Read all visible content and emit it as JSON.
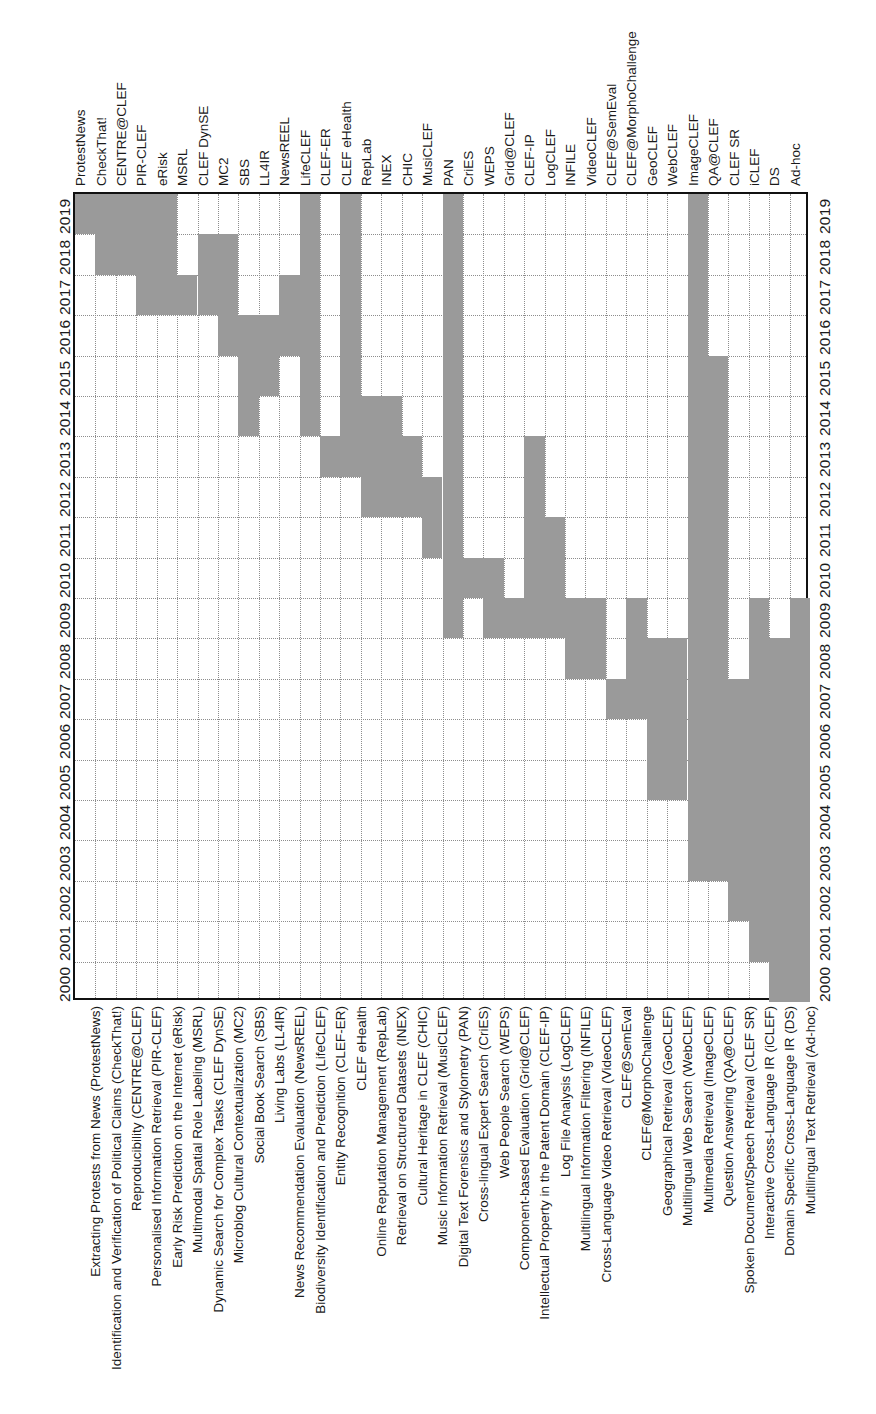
{
  "figure": {
    "kind": "timeline-matrix",
    "cell_color": "#9a9a9a",
    "grid_color": "#8d8d8d",
    "frame_color": "#111111"
  },
  "axes": {
    "year_axis_label": "",
    "lab_axis_label": "",
    "years": [
      2000,
      2001,
      2002,
      2003,
      2004,
      2005,
      2006,
      2007,
      2008,
      2009,
      2010,
      2011,
      2012,
      2013,
      2014,
      2015,
      2016,
      2017,
      2018,
      2019
    ]
  },
  "chart_data": {
    "type": "heatmap",
    "title": "",
    "subtitle": "",
    "xlabel": "",
    "ylabel": "",
    "grid": true,
    "legend": "none",
    "orientation": "labs-on-horizontal-axis, years-on-vertical-axis-ascending-upward",
    "x": [
      "ProtestNews",
      "CheckThat!",
      "CENTRE@CLEF",
      "PIR-CLEF",
      "eRisk",
      "MSRL",
      "CLEF DynSE",
      "MC2",
      "SBS",
      "LL4IR",
      "NewsREEL",
      "LifeCLEF",
      "CLEF-ER",
      "CLEF eHealth",
      "RepLab",
      "INEX",
      "CHIC",
      "MusiCLEF",
      "PAN",
      "CriES",
      "WEPS",
      "Grid@CLEF",
      "CLEF-IP",
      "LogCLEF",
      "INFILE",
      "VideoCLEF",
      "CLEF@SemEval",
      "CLEF@MorphoChallenge",
      "GeoCLEF",
      "WebCLEF",
      "ImageCLEF",
      "QA@CLEF",
      "CLEF SR",
      "iCLEF",
      "DS",
      "Ad-hoc"
    ],
    "categories": [
      2000,
      2001,
      2002,
      2003,
      2004,
      2005,
      2006,
      2007,
      2008,
      2009,
      2010,
      2011,
      2012,
      2013,
      2014,
      2015,
      2016,
      2017,
      2018,
      2019
    ],
    "ylim": [
      2000,
      2019
    ],
    "series": [
      {
        "name": "ProtestNews",
        "short": "ProtestNews",
        "full": "Extracting Protests from News (ProtestNews)",
        "start": 2019,
        "end": 2019
      },
      {
        "name": "CheckThat!",
        "short": "CheckThat!",
        "full": "Identification and Verification of Political Claims (CheckThat!)",
        "start": 2018,
        "end": 2019
      },
      {
        "name": "CENTRE@CLEF",
        "short": "CENTRE@CLEF",
        "full": "Reproducibility (CENTRE@CLEF)",
        "start": 2018,
        "end": 2019
      },
      {
        "name": "PIR-CLEF",
        "short": "PIR-CLEF",
        "full": "Personalised Information Retrieval (PIR-CLEF)",
        "start": 2017,
        "end": 2019
      },
      {
        "name": "eRisk",
        "short": "eRisk",
        "full": "Early Risk Prediction on the Internet (eRisk)",
        "start": 2017,
        "end": 2019
      },
      {
        "name": "MSRL",
        "short": "MSRL",
        "full": "Multimodal Spatial Role Labeling (MSRL)",
        "start": 2017,
        "end": 2017
      },
      {
        "name": "CLEF DynSE",
        "short": "CLEF DynSE",
        "full": "Dynamic Search for Complex Tasks (CLEF DynSE)",
        "start": 2017,
        "end": 2018
      },
      {
        "name": "MC2",
        "short": "MC2",
        "full": "Microblog Cultural Contextualization (MC2)",
        "start": 2016,
        "end": 2018
      },
      {
        "name": "SBS",
        "short": "SBS",
        "full": "Social Book Search (SBS)",
        "start": 2014,
        "end": 2016
      },
      {
        "name": "LL4IR",
        "short": "LL4IR",
        "full": "Living Labs (LL4IR)",
        "start": 2015,
        "end": 2016
      },
      {
        "name": "NewsREEL",
        "short": "NewsREEL",
        "full": "News Recommendation Evaluation (NewsREEL)",
        "start": 2016,
        "end": 2017
      },
      {
        "name": "LifeCLEF",
        "short": "LifeCLEF",
        "full": "Biodiversity Identification and Prediction (LifeCLEF)",
        "start": 2014,
        "end": 2019
      },
      {
        "name": "CLEF-ER",
        "short": "CLEF-ER",
        "full": "Entity Recognition (CLEF-ER)",
        "start": 2013,
        "end": 2013
      },
      {
        "name": "CLEF eHealth",
        "short": "CLEF eHealth",
        "full": "CLEF eHealth",
        "start": 2013,
        "end": 2019
      },
      {
        "name": "RepLab",
        "short": "RepLab",
        "full": "Online Reputation Management (RepLab)",
        "start": 2012,
        "end": 2014
      },
      {
        "name": "INEX",
        "short": "INEX",
        "full": "Retrieval on Structured Datasets (INEX)",
        "start": 2012,
        "end": 2014
      },
      {
        "name": "CHIC",
        "short": "CHIC",
        "full": "Cultural Heritage in CLEF (CHIC)",
        "start": 2012,
        "end": 2013
      },
      {
        "name": "MusiCLEF",
        "short": "MusiCLEF",
        "full": "Music Information Retrieval (MusiCLEF)",
        "start": 2011,
        "end": 2012
      },
      {
        "name": "PAN",
        "short": "PAN",
        "full": "Digital Text Forensics and Stylometry (PAN)",
        "start": 2009,
        "end": 2019
      },
      {
        "name": "CriES",
        "short": "CriES",
        "full": "Cross-lingual Expert Search (CriES)",
        "start": 2010,
        "end": 2010
      },
      {
        "name": "WEPS",
        "short": "WEPS",
        "full": "Web People Search (WEPS)",
        "start": 2009,
        "end": 2010
      },
      {
        "name": "Grid@CLEF",
        "short": "Grid@CLEF",
        "full": "Component-based Evaluation (Grid@CLEF)",
        "start": 2009,
        "end": 2009
      },
      {
        "name": "CLEF-IP",
        "short": "CLEF-IP",
        "full": "Intellectual Property in the Patent Domain (CLEF-IP)",
        "start": 2009,
        "end": 2013
      },
      {
        "name": "LogCLEF",
        "short": "LogCLEF",
        "full": "Log File Analysis (LogCLEF)",
        "start": 2009,
        "end": 2011
      },
      {
        "name": "INFILE",
        "short": "INFILE",
        "full": "Multilingual Information Filtering (INFILE)",
        "start": 2008,
        "end": 2009
      },
      {
        "name": "VideoCLEF",
        "short": "VideoCLEF",
        "full": "Cross-Language Video Retrieval (VideoCLEF)",
        "start": 2008,
        "end": 2009
      },
      {
        "name": "CLEF@SemEval",
        "short": "CLEF@SemEval",
        "full": "CLEF@SemEval",
        "start": 2007,
        "end": 2007
      },
      {
        "name": "CLEF@MorphoChallenge",
        "short": "CLEF@MorphoChallenge",
        "full": "CLEF@MorphoChallenge",
        "start": 2007,
        "end": 2009
      },
      {
        "name": "GeoCLEF",
        "short": "GeoCLEF",
        "full": "Geographical Retrieval (GeoCLEF)",
        "start": 2005,
        "end": 2008
      },
      {
        "name": "WebCLEF",
        "short": "WebCLEF",
        "full": "Multilingual Web Search (WebCLEF)",
        "start": 2005,
        "end": 2008
      },
      {
        "name": "ImageCLEF",
        "short": "ImageCLEF",
        "full": "Multimedia Retrieval (ImageCLEF)",
        "start": 2003,
        "end": 2019
      },
      {
        "name": "QA@CLEF",
        "short": "QA@CLEF",
        "full": "Question Answering (QA@CLEF)",
        "start": 2003,
        "end": 2015
      },
      {
        "name": "CLEF SR",
        "short": "CLEF SR",
        "full": "Spoken Document/Speech Retrieval (CLEF SR)",
        "start": 2002,
        "end": 2007
      },
      {
        "name": "iCLEF",
        "short": "iCLEF",
        "full": "Interactive Cross-Language IR (iCLEF)",
        "start": 2001,
        "end": 2009
      },
      {
        "name": "DS",
        "short": "DS",
        "full": "Domain Specific Cross-Language IR (DS)",
        "start": 2000,
        "end": 2008
      },
      {
        "name": "Ad-hoc",
        "short": "Ad-hoc",
        "full": "Multilingual Text Retrieval (Ad-hoc)",
        "start": 2000,
        "end": 2009
      }
    ]
  }
}
